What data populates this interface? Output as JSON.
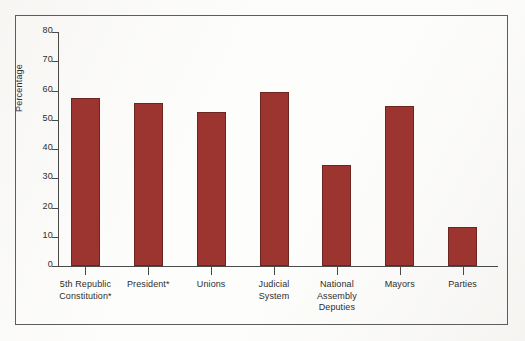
{
  "chart_data": {
    "type": "bar",
    "title": "",
    "xlabel": "",
    "ylabel": "Percentage",
    "ylim": [
      0,
      80
    ],
    "ytick_step": 10,
    "grid": false,
    "legend": false,
    "bar_color": "#9c3530",
    "bar_edge_color": "#6e2520",
    "categories": [
      "5th Republic Constitution*",
      "President*",
      "Unions",
      "Judicial System",
      "National Assembly Deputies",
      "Mayors",
      "Parties"
    ],
    "category_lines": [
      [
        "5th Republic",
        "Constitution*"
      ],
      [
        "President*"
      ],
      [
        "Unions"
      ],
      [
        "Judicial",
        "System"
      ],
      [
        "National",
        "Assembly",
        "Deputies"
      ],
      [
        "Mayors"
      ],
      [
        "Parties"
      ]
    ],
    "values": [
      57.4,
      55.7,
      52.6,
      59.5,
      34.5,
      54.7,
      13.3
    ],
    "ytick_labels": [
      "80",
      "70",
      "60",
      "50",
      "40",
      "30",
      "20",
      "10",
      "0"
    ],
    "ytick_values": [
      80,
      70,
      60,
      50,
      40,
      30,
      20,
      10,
      0
    ]
  },
  "axis": {
    "y_title": "Percentage"
  }
}
